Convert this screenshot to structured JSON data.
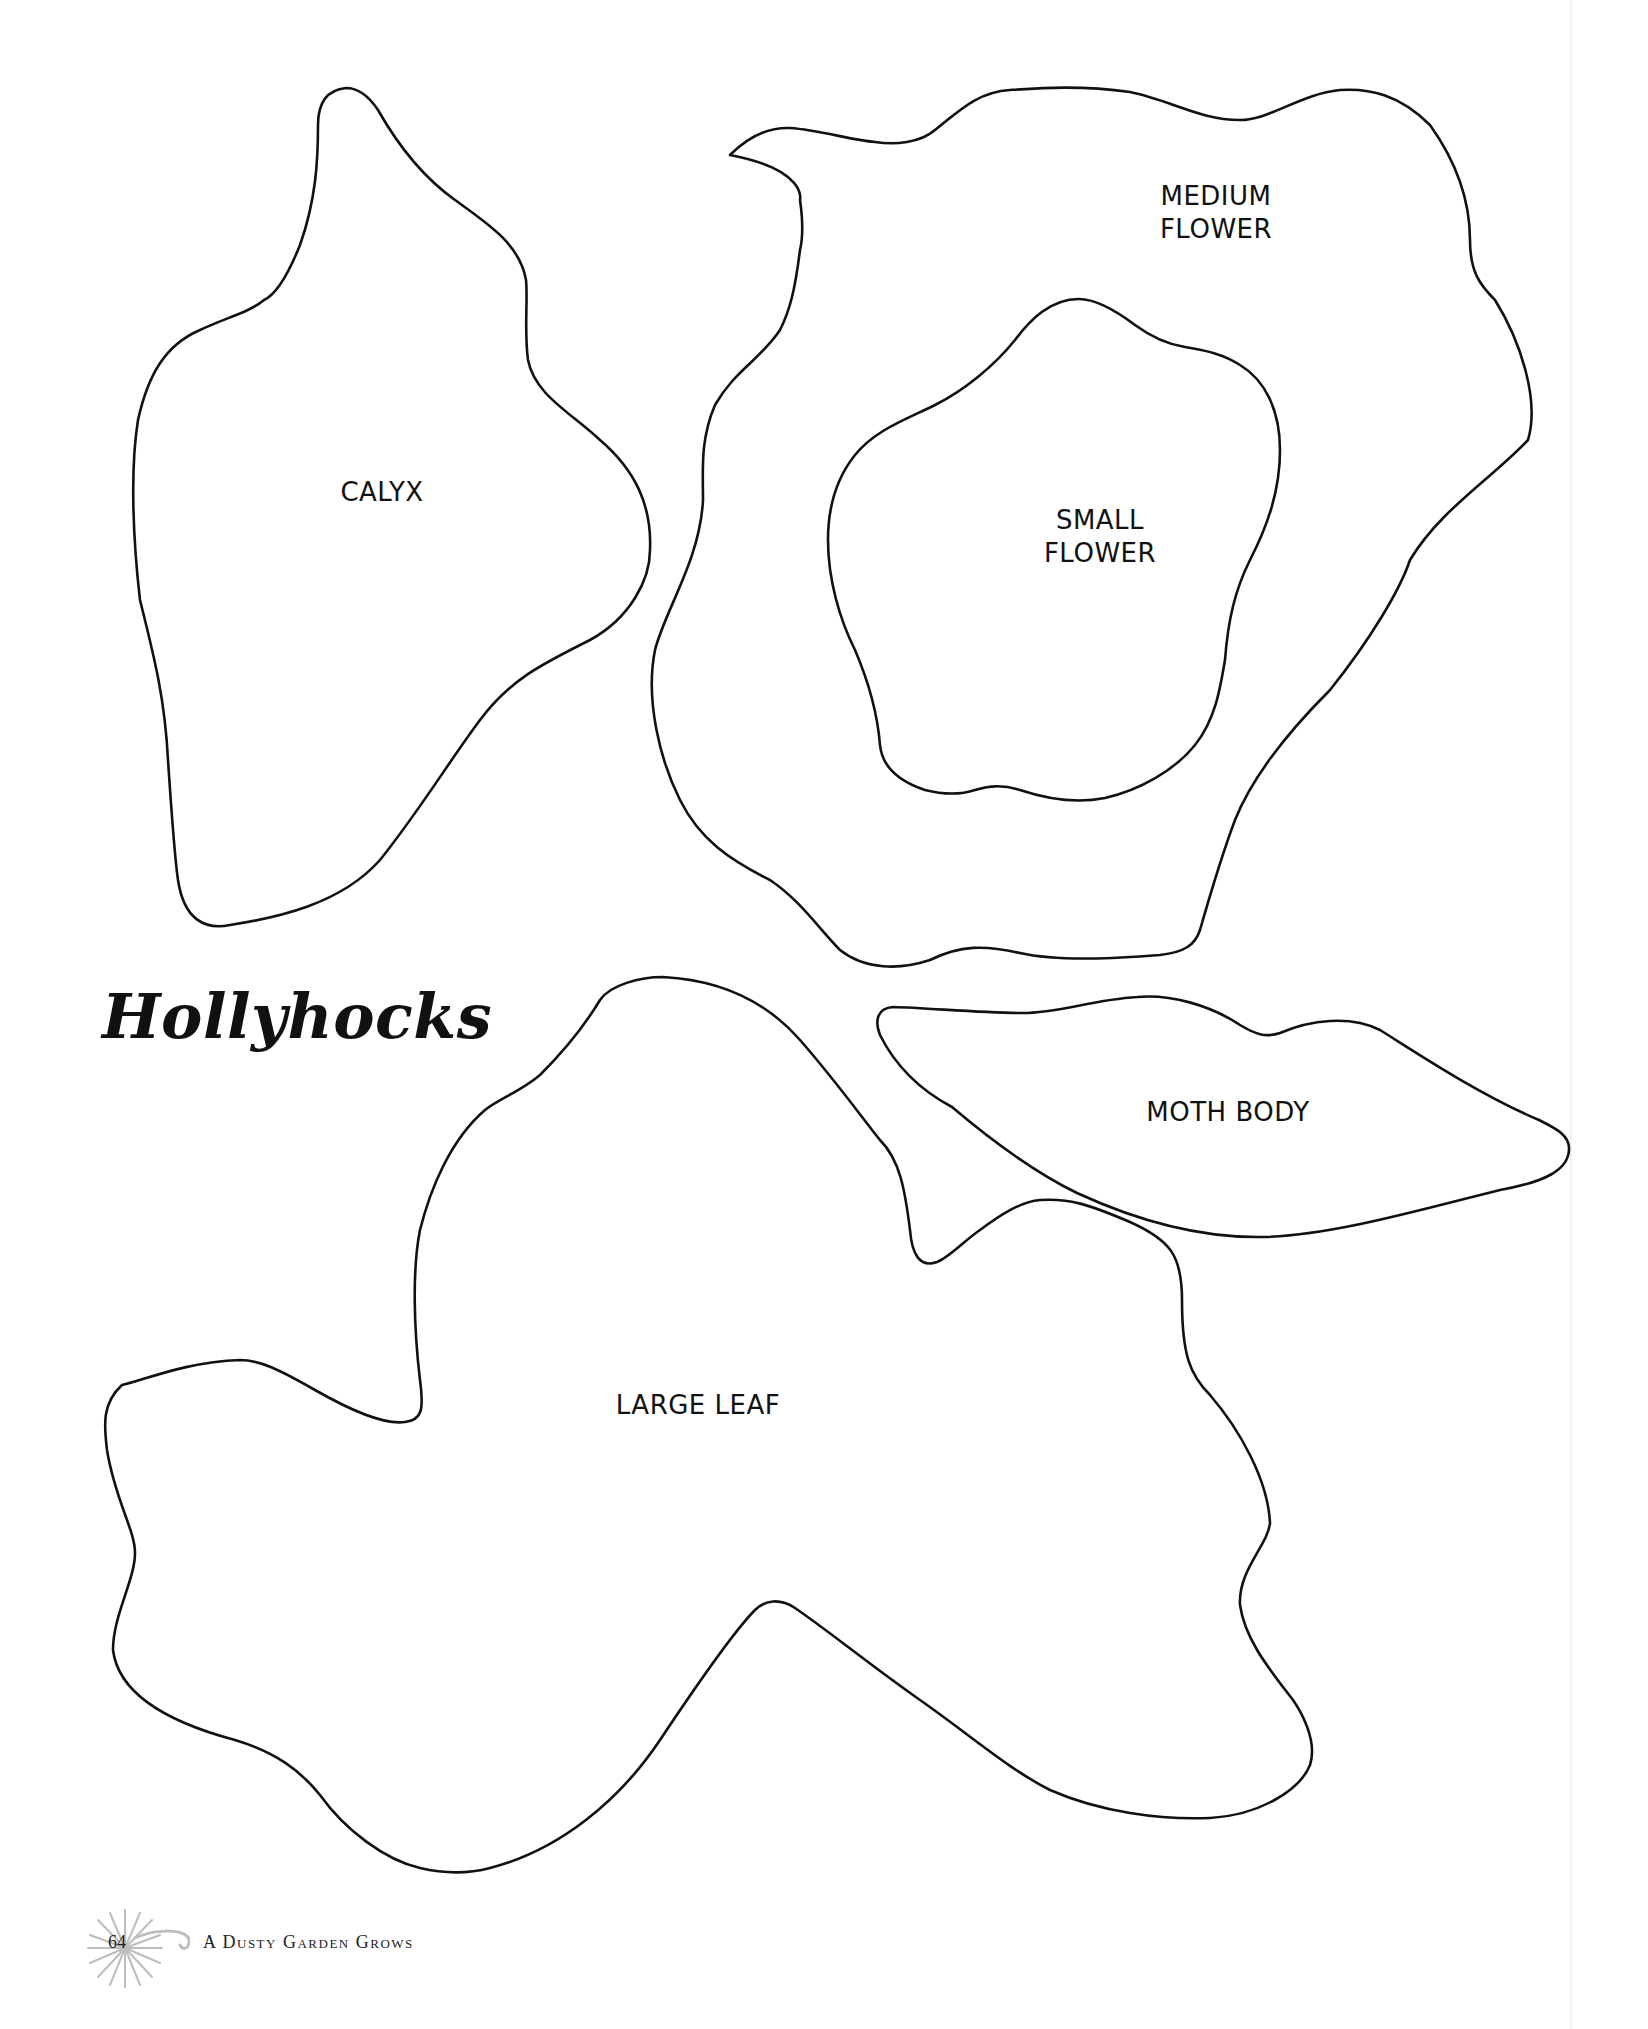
{
  "page": {
    "title": "Hollyhocks",
    "page_number": "64",
    "running_footer": "A Dusty Garden Grows"
  },
  "templates": [
    {
      "id": "calyx",
      "label": "CALYX"
    },
    {
      "id": "medium_flower",
      "label_line1": "MEDIUM",
      "label_line2": "FLOWER"
    },
    {
      "id": "small_flower",
      "label_line1": "SMALL",
      "label_line2": "FLOWER"
    },
    {
      "id": "moth_body",
      "label": "MOTH BODY"
    },
    {
      "id": "large_leaf",
      "label": "LARGE LEAF"
    }
  ],
  "icons": {
    "footer_ornament": "dandelion-starburst-icon"
  },
  "colors": {
    "ink": "#111111",
    "ornament": "#bdbdbd",
    "background": "#ffffff"
  }
}
